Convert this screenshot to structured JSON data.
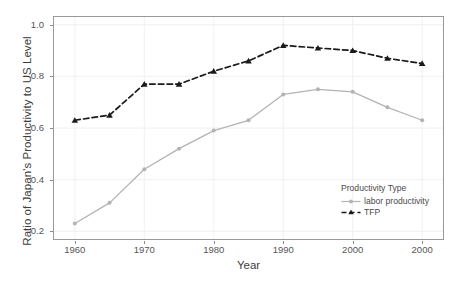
{
  "chart_data": {
    "type": "line",
    "title": "",
    "xlabel": "Year",
    "ylabel": "Ratio of Japan's Productivity to US Level",
    "x": [
      1960,
      1965,
      1970,
      1975,
      1980,
      1985,
      1990,
      1995,
      2000,
      2005,
      2010
    ],
    "xlim": [
      1957,
      2013
    ],
    "ylim": [
      0.17,
      1.03
    ],
    "x_tick_values": [
      1960,
      1970,
      1980,
      1990,
      2000,
      2010
    ],
    "x_tick_labels": [
      "1960",
      "1970",
      "1980",
      "1990",
      "2000",
      "2000"
    ],
    "y_tick_values": [
      0.2,
      0.4,
      0.6,
      0.8,
      1.0
    ],
    "y_tick_labels": [
      "0.2",
      "0.4",
      "0.6",
      "0.8",
      "1.0"
    ],
    "grid": true,
    "legend_position": "bottom-right",
    "legend_title": "Productivity Type",
    "series": [
      {
        "name": "labor productivity",
        "color": "#b3b3b3",
        "linestyle": "solid",
        "marker": "circle",
        "values": [
          0.23,
          0.31,
          0.44,
          0.52,
          0.59,
          0.63,
          0.73,
          0.75,
          0.74,
          0.68,
          0.63
        ]
      },
      {
        "name": "TFP",
        "color": "#1a1a1a",
        "linestyle": "dashed",
        "marker": "triangle",
        "values": [
          0.63,
          0.65,
          0.77,
          0.77,
          0.82,
          0.86,
          0.92,
          0.91,
          0.9,
          0.87,
          0.85
        ]
      }
    ]
  },
  "legend": {
    "title": "Productivity Type",
    "items": [
      {
        "label": "labor productivity"
      },
      {
        "label": "TFP"
      }
    ]
  },
  "axes": {
    "x_title": "Year",
    "y_title": "Ratio of Japan's Productivity to US Level"
  },
  "colors": {
    "labor_productivity": "#b3b3b3",
    "tfp": "#1a1a1a",
    "gridline": "#f0f0f0",
    "panel_border": "#999999",
    "text": "#4d4d4d"
  }
}
